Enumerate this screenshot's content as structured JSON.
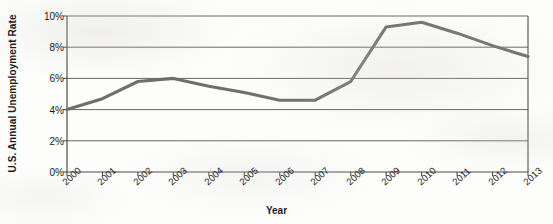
{
  "chart_data": {
    "type": "line",
    "title": "",
    "xlabel": "Year",
    "ylabel": "U.S. Annual Unemployment Rate",
    "categories": [
      "2000",
      "2001",
      "2002",
      "2003",
      "2004",
      "2005",
      "2006",
      "2007",
      "2008",
      "2009",
      "2010",
      "2011",
      "2012",
      "2013"
    ],
    "values": [
      4.0,
      4.7,
      5.8,
      6.0,
      5.5,
      5.1,
      4.6,
      4.6,
      5.8,
      9.3,
      9.6,
      8.9,
      8.1,
      7.4
    ],
    "series": [
      {
        "name": "U.S. Annual Unemployment Rate",
        "values": [
          4.0,
          4.7,
          5.8,
          6.0,
          5.5,
          5.1,
          4.6,
          4.6,
          5.8,
          9.3,
          9.6,
          8.9,
          8.1,
          7.4
        ]
      }
    ],
    "ylim": [
      0,
      10
    ],
    "ytick_labels": [
      "0%",
      "2%",
      "4%",
      "6%",
      "8%",
      "10%"
    ],
    "ytick_values": [
      0,
      2,
      4,
      6,
      8,
      10
    ],
    "xtick_labels": [
      "2000",
      "2001",
      "2002",
      "2003",
      "2004",
      "2005",
      "2006",
      "2007",
      "2008",
      "2009",
      "2010",
      "2011",
      "2012",
      "2013"
    ],
    "grid": true,
    "grid_axis": "y",
    "legend": false,
    "legend_position": "none",
    "line_color": "#6e6e6e",
    "grid_color": "#555555",
    "axis_color": "#4a4a4a",
    "background_color": "#fdfdfc",
    "text_color": "#1a1a1a"
  }
}
